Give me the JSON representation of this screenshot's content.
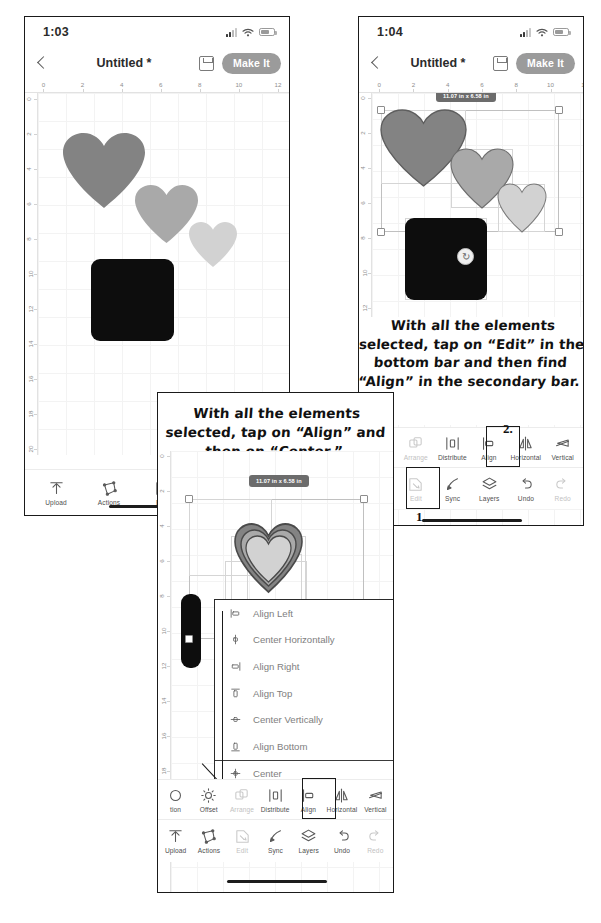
{
  "meta": {
    "app": "Cricut Design Space",
    "accent_gray": "#9b9b9b",
    "heart_colors": [
      "#838383",
      "#a9a9a9",
      "#d2d2d2"
    ],
    "square_color": "#0d0d0d"
  },
  "ruler": {
    "horizontal_ticks": [
      "0",
      "2",
      "4",
      "6",
      "8",
      "10",
      "12"
    ],
    "vertical_ticks": [
      "0",
      "2",
      "4",
      "6",
      "8",
      "10",
      "12",
      "14",
      "16",
      "18",
      "20",
      "22"
    ]
  },
  "phone1": {
    "status": {
      "clock": "1:03",
      "signal_icon": "cellular-signal-icon",
      "wifi_icon": "wifi-icon",
      "battery_icon": "battery-icon"
    },
    "header": {
      "back_icon": "back-chevron-icon",
      "title": "Untitled *",
      "save_icon": "save-icon",
      "make_it_label": "Make It"
    },
    "toolbar": [
      {
        "label": "Upload",
        "icon": "upload-icon",
        "dim": false
      },
      {
        "label": "Actions",
        "icon": "actions-icon",
        "dim": false
      },
      {
        "label": "Edit",
        "icon": "edit-icon",
        "dim": false
      },
      {
        "label": "Sync",
        "icon": "sync-icon",
        "dim": false
      }
    ]
  },
  "phone2": {
    "status": {
      "clock": "1:04",
      "signal_icon": "cellular-signal-icon",
      "wifi_icon": "wifi-icon",
      "battery_icon": "battery-icon"
    },
    "header": {
      "back_icon": "back-chevron-icon",
      "title": "Untitled *",
      "save_icon": "save-icon",
      "make_it_label": "Make It"
    },
    "selection": {
      "size_label": "11.07 in x 6.58 in",
      "rotate_icon": "rotate-handle-icon"
    },
    "secondary_toolbar": [
      {
        "label": "Offset",
        "icon": "offset-icon",
        "dim": false
      },
      {
        "label": "Arrange",
        "icon": "arrange-icon",
        "dim": true
      },
      {
        "label": "Distribute",
        "icon": "distribute-icon",
        "dim": false
      },
      {
        "label": "Align",
        "icon": "align-icon",
        "dim": false
      },
      {
        "label": "Horizontal",
        "icon": "flip-horizontal-icon",
        "dim": false
      },
      {
        "label": "Vertical",
        "icon": "flip-vertical-icon",
        "dim": false
      }
    ],
    "primary_toolbar": [
      {
        "label": "Actions",
        "icon": "actions-icon",
        "dim": false
      },
      {
        "label": "Edit",
        "icon": "edit-icon",
        "dim": true
      },
      {
        "label": "Sync",
        "icon": "sync-icon",
        "dim": false
      },
      {
        "label": "Layers",
        "icon": "layers-icon",
        "dim": false
      },
      {
        "label": "Undo",
        "icon": "undo-icon",
        "dim": false
      },
      {
        "label": "Redo",
        "icon": "redo-icon",
        "dim": true
      }
    ],
    "annotation": "With all the elements selected, tap on “Edit” in the bottom bar and then find “Align” in the secondary  bar.",
    "step_markers": {
      "one": "1.",
      "two": "2."
    }
  },
  "phone3": {
    "annotation": "With all the elements selected, tap on “Align” and then on “Center.”",
    "selection": {
      "size_label": "11.07 in x 6.58 in"
    },
    "align_menu": [
      {
        "label": "Align Left",
        "icon": "align-left-icon"
      },
      {
        "label": "Center Horizontally",
        "icon": "center-horizontally-icon"
      },
      {
        "label": "Align Right",
        "icon": "align-right-icon"
      },
      {
        "label": "Align Top",
        "icon": "align-top-icon"
      },
      {
        "label": "Center Vertically",
        "icon": "center-vertically-icon"
      },
      {
        "label": "Align Bottom",
        "icon": "align-bottom-icon"
      },
      {
        "label": "Center",
        "icon": "center-icon"
      }
    ],
    "secondary_toolbar": [
      {
        "label": "tion",
        "icon": "selection-icon",
        "dim": false
      },
      {
        "label": "Offset",
        "icon": "offset-icon",
        "dim": false
      },
      {
        "label": "Arrange",
        "icon": "arrange-icon",
        "dim": true
      },
      {
        "label": "Distribute",
        "icon": "distribute-icon",
        "dim": false
      },
      {
        "label": "Align",
        "icon": "align-icon",
        "dim": false
      },
      {
        "label": "Horizontal",
        "icon": "flip-horizontal-icon",
        "dim": false
      },
      {
        "label": "Vertical",
        "icon": "flip-vertical-icon",
        "dim": false
      }
    ],
    "primary_toolbar": [
      {
        "label": "Upload",
        "icon": "upload-icon",
        "dim": false
      },
      {
        "label": "Actions",
        "icon": "actions-icon",
        "dim": false
      },
      {
        "label": "Edit",
        "icon": "edit-icon",
        "dim": true
      },
      {
        "label": "Sync",
        "icon": "sync-icon",
        "dim": false
      },
      {
        "label": "Layers",
        "icon": "layers-icon",
        "dim": false
      },
      {
        "label": "Undo",
        "icon": "undo-icon",
        "dim": false
      },
      {
        "label": "Redo",
        "icon": "redo-icon",
        "dim": true
      }
    ]
  }
}
